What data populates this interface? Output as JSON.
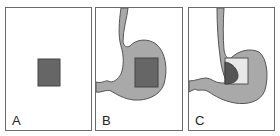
{
  "panels": [
    {
      "label": "A",
      "description": "Square region alone"
    },
    {
      "label": "B",
      "description": "Square overlaid on stomach outline"
    },
    {
      "label": "C",
      "description": "Square at gastroesophageal junction with dark partial fill"
    }
  ],
  "colors": {
    "border": "#6a6a6a",
    "stomach_fill": "#a9a9a9",
    "stomach_stroke": "#555555",
    "square_fill": "#666666",
    "square_light_fill": "#e8e8e8",
    "dark_region": "#555555"
  }
}
